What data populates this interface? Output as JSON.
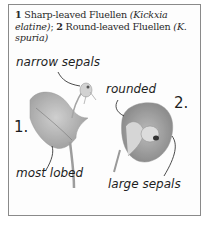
{
  "caption": {
    "num1": "1",
    "name1": " Sharp-leaved Fluellen ",
    "latin1": "(Kickxia elatine)",
    "sep": "; ",
    "num2": "2",
    "name2": " Round-leaved Fluellen ",
    "latin2": "(K. spuria)"
  },
  "annotations": {
    "narrow_sepals": "narrow sepals",
    "most_lobed": "most lobed",
    "rounded": "rounded",
    "large_sepals": "large sepals"
  },
  "labels": {
    "plant1": "1.",
    "plant2": "2."
  },
  "colors": {
    "border": "#8a8a8a",
    "ink": "#1e1e1e",
    "leaf": "#9a9a9a"
  }
}
